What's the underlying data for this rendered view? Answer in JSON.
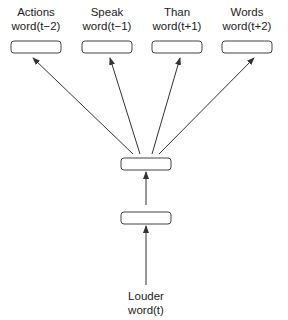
{
  "diagram": {
    "input": {
      "word": "Louder",
      "position": "word(t)"
    },
    "outputs": [
      {
        "word": "Actions",
        "position": "word(t−2)"
      },
      {
        "word": "Speak",
        "position": "word(t−1)"
      },
      {
        "word": "Than",
        "position": "word(t+1)"
      },
      {
        "word": "Words",
        "position": "word(t+2)"
      }
    ],
    "colors": {
      "stroke": "#333333",
      "text": "#222222"
    }
  }
}
